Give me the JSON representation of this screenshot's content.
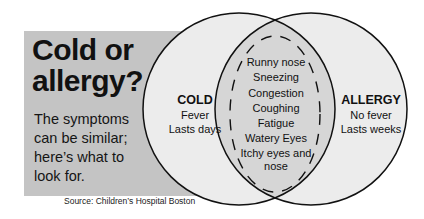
{
  "header": {
    "title": "Cold or\nallergy?",
    "subtitle": "The symptoms\ncan be similar;\nhere’s what to\nlook for."
  },
  "source": "Source: Children’s Hospital Boston",
  "colors": {
    "panel": "#c4c4c4",
    "circle_fill": "#ececec",
    "overlap_fill": "#d6d6d6",
    "stroke": "#111111"
  },
  "cold": {
    "heading": "COLD",
    "items": [
      "Fever",
      "Lasts days"
    ]
  },
  "allergy": {
    "heading": "ALLERGY",
    "items": [
      "No fever",
      "Lasts weeks"
    ]
  },
  "shared": {
    "items": [
      "Runny nose",
      "Sneezing",
      "Congestion",
      "Coughing",
      "Fatigue",
      "Watery Eyes",
      "Itchy eyes and",
      "nose"
    ]
  }
}
